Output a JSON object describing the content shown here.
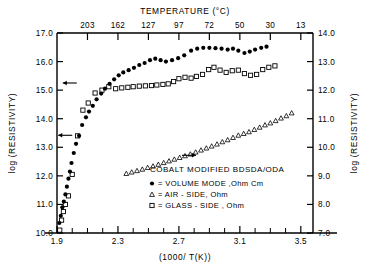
{
  "chart_data": {
    "type": "scatter",
    "title": "",
    "annotation": "COBALT MODIFIED BDSDA/ODA",
    "xlabel": "(1000/ T(K))",
    "ylabel": "log (RESISTIVITY)",
    "ylabel_right": "log (RESISTIVITY)",
    "xlabel_top": "TEMPERATURE (°C)",
    "xlim": [
      1.9,
      3.58
    ],
    "ylim": [
      10.0,
      17.0
    ],
    "ylim_right": [
      7.0,
      14.0
    ],
    "grid": false,
    "legend_position": "lower-right",
    "xticks": [
      1.9,
      2.0,
      2.1,
      2.2,
      2.3,
      2.4,
      2.5,
      2.6,
      2.7,
      2.8,
      2.9,
      3.0,
      3.1,
      3.2,
      3.3,
      3.4,
      3.5
    ],
    "xticklabels": [
      "1.9",
      "",
      "",
      "",
      "2.3",
      "",
      "",
      "",
      "2.7",
      "",
      "",
      "",
      "3.1",
      "",
      "",
      "",
      "3.5"
    ],
    "yticks": [
      10.0,
      11.0,
      12.0,
      13.0,
      14.0,
      15.0,
      16.0,
      17.0
    ],
    "yticklabels": [
      "10.0",
      "11.0",
      "12.0",
      "13.0",
      "14.0",
      "15.0",
      "16.0",
      "17.0"
    ],
    "yticks_right": [
      7.0,
      8.0,
      9.0,
      10.0,
      11.0,
      12.0,
      13.0,
      14.0
    ],
    "yticklabels_right": [
      "7.0",
      "8.0",
      "9.0",
      "10.0",
      "11.0",
      "12.0",
      "13.0",
      "14.0"
    ],
    "top_axis": {
      "label": "TEMPERATURE (°C)",
      "ticks_celsius": [
        203,
        162,
        127,
        97,
        72,
        50,
        30,
        13
      ],
      "ticks_x": [
        2.1,
        2.3,
        2.5,
        2.7,
        2.9,
        3.1,
        3.3,
        3.5
      ],
      "ticklabels": [
        "203",
        "162",
        "127",
        "97",
        "72",
        "50",
        "30",
        "13"
      ]
    },
    "series": [
      {
        "name": "VOLUME MODE, Ohm Cm",
        "marker": "filled-circle",
        "axis": "left",
        "points": [
          [
            1.915,
            10.35
          ],
          [
            1.925,
            10.6
          ],
          [
            1.935,
            10.9
          ],
          [
            1.945,
            11.1
          ],
          [
            1.955,
            11.35
          ],
          [
            1.965,
            11.62
          ],
          [
            1.975,
            11.9
          ],
          [
            1.985,
            12.15
          ],
          [
            1.995,
            12.45
          ],
          [
            2.01,
            12.8
          ],
          [
            2.025,
            13.12
          ],
          [
            2.045,
            13.4
          ],
          [
            2.065,
            13.78
          ],
          [
            2.09,
            14.05
          ],
          [
            2.11,
            14.25
          ],
          [
            2.135,
            14.45
          ],
          [
            2.16,
            14.68
          ],
          [
            2.19,
            14.88
          ],
          [
            2.215,
            15.05
          ],
          [
            2.245,
            15.22
          ],
          [
            2.275,
            15.38
          ],
          [
            2.305,
            15.52
          ],
          [
            2.335,
            15.62
          ],
          [
            2.37,
            15.7
          ],
          [
            2.405,
            15.78
          ],
          [
            2.44,
            15.88
          ],
          [
            2.475,
            15.95
          ],
          [
            2.51,
            16.05
          ],
          [
            2.545,
            16.1
          ],
          [
            2.58,
            16.05
          ],
          [
            2.615,
            16.0
          ],
          [
            2.655,
            16.05
          ],
          [
            2.695,
            16.12
          ],
          [
            2.735,
            16.22
          ],
          [
            2.78,
            16.38
          ],
          [
            2.82,
            16.45
          ],
          [
            2.86,
            16.48
          ],
          [
            2.9,
            16.48
          ],
          [
            2.94,
            16.47
          ],
          [
            2.98,
            16.45
          ],
          [
            3.02,
            16.42
          ],
          [
            3.055,
            16.45
          ],
          [
            3.09,
            16.38
          ],
          [
            3.13,
            16.3
          ],
          [
            3.165,
            16.35
          ],
          [
            3.2,
            16.42
          ],
          [
            3.24,
            16.48
          ],
          [
            3.275,
            16.52
          ]
        ]
      },
      {
        "name": "AIR - SIDE, Ohm",
        "marker": "open-triangle",
        "axis": "right",
        "points": [
          [
            2.355,
            9.08
          ],
          [
            2.39,
            9.13
          ],
          [
            2.425,
            9.18
          ],
          [
            2.46,
            9.23
          ],
          [
            2.495,
            9.29
          ],
          [
            2.53,
            9.34
          ],
          [
            2.565,
            9.4
          ],
          [
            2.6,
            9.46
          ],
          [
            2.635,
            9.52
          ],
          [
            2.67,
            9.58
          ],
          [
            2.705,
            9.64
          ],
          [
            2.74,
            9.7
          ],
          [
            2.775,
            9.76
          ],
          [
            2.81,
            9.83
          ],
          [
            2.845,
            9.9
          ],
          [
            2.88,
            9.97
          ],
          [
            2.915,
            10.04
          ],
          [
            2.95,
            10.11
          ],
          [
            2.985,
            10.19
          ],
          [
            3.02,
            10.26
          ],
          [
            3.055,
            10.34
          ],
          [
            3.09,
            10.42
          ],
          [
            3.125,
            10.48
          ],
          [
            3.16,
            10.54
          ],
          [
            3.195,
            10.62
          ],
          [
            3.23,
            10.7
          ],
          [
            3.265,
            10.78
          ],
          [
            3.3,
            10.85
          ],
          [
            3.335,
            10.93
          ],
          [
            3.37,
            11.02
          ],
          [
            3.405,
            11.1
          ],
          [
            3.44,
            11.2
          ]
        ]
      },
      {
        "name": "GLASS - SIDE, Ohm",
        "marker": "open-square",
        "axis": "right",
        "points": [
          [
            1.918,
            7.1
          ],
          [
            1.93,
            7.45
          ],
          [
            1.942,
            7.75
          ],
          [
            1.955,
            8.0
          ],
          [
            1.975,
            8.3
          ],
          [
            2.0,
            9.05
          ],
          [
            2.035,
            10.4
          ],
          [
            2.07,
            11.3
          ],
          [
            2.105,
            11.55
          ],
          [
            2.15,
            11.9
          ],
          [
            2.195,
            12.0
          ],
          [
            2.24,
            12.12
          ],
          [
            2.285,
            12.05
          ],
          [
            2.325,
            12.08
          ],
          [
            2.365,
            12.1
          ],
          [
            2.4,
            12.12
          ],
          [
            2.44,
            12.14
          ],
          [
            2.48,
            12.15
          ],
          [
            2.52,
            12.16
          ],
          [
            2.555,
            12.18
          ],
          [
            2.595,
            12.2
          ],
          [
            2.63,
            12.22
          ],
          [
            2.665,
            12.3
          ],
          [
            2.7,
            12.4
          ],
          [
            2.74,
            12.45
          ],
          [
            2.78,
            12.42
          ],
          [
            2.815,
            12.48
          ],
          [
            2.855,
            12.55
          ],
          [
            2.895,
            12.72
          ],
          [
            2.93,
            12.8
          ],
          [
            2.97,
            12.7
          ],
          [
            3.01,
            12.62
          ],
          [
            3.05,
            12.68
          ],
          [
            3.09,
            12.7
          ],
          [
            3.13,
            12.58
          ],
          [
            3.17,
            12.52
          ],
          [
            3.21,
            12.55
          ],
          [
            3.25,
            12.72
          ],
          [
            3.29,
            12.8
          ],
          [
            3.33,
            12.85
          ]
        ]
      }
    ],
    "arrows": [
      {
        "name": "left-arrow-glass-upper",
        "direction": "left",
        "x": 2.03,
        "y_left": 15.25
      },
      {
        "name": "left-arrow-volume",
        "direction": "left",
        "x": 2.0,
        "y_left": 13.42
      },
      {
        "name": "right-arrow-air",
        "direction": "right",
        "x": 2.72,
        "y_right": 9.72
      }
    ]
  },
  "legend": {
    "title": "COBALT MODIFIED BDSDA/ODA",
    "entries": [
      {
        "marker": "filled-circle",
        "eq": "=",
        "label": "VOLUME MODE ,Ohm Cm"
      },
      {
        "marker": "open-triangle",
        "eq": "=",
        "label": "AIR - SIDE, Ohm"
      },
      {
        "marker": "open-square",
        "eq": "=",
        "label": "GLASS - SIDE , Ohm"
      }
    ]
  },
  "colors": {
    "ink": "#000000",
    "background": "#ffffff"
  }
}
